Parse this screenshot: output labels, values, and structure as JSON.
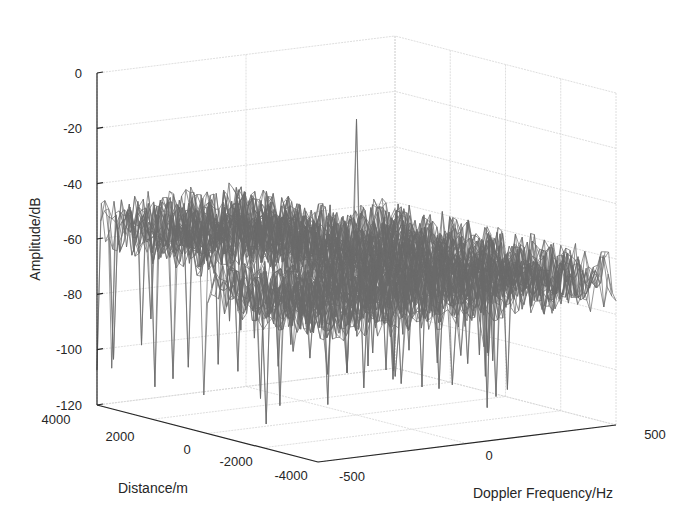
{
  "chart_data": {
    "type": "surface3d",
    "title": "",
    "xlabel": "Doppler Frequency/Hz",
    "ylabel": "Distance/m",
    "zlabel": "Amplitude/dB",
    "x_ticks": [
      "-500",
      "0",
      "500"
    ],
    "y_ticks": [
      "4000",
      "2000",
      "0",
      "-2000",
      "-4000"
    ],
    "z_ticks": [
      "0",
      "-20",
      "-40",
      "-60",
      "-80",
      "-100",
      "-120"
    ],
    "xlim": [
      -500,
      500
    ],
    "ylim": [
      -4000,
      4000
    ],
    "zlim": [
      -120,
      0
    ],
    "grid": true,
    "legend": null,
    "surface": {
      "noise_floor_db": -68,
      "noise_spread_db": 10,
      "deep_nulls_db": [
        -100,
        -115
      ],
      "raised_region": {
        "doppler_range_hz": [
          -500,
          0
        ],
        "distance_range_m": [
          0,
          4000
        ],
        "level_db": -55
      },
      "peak": {
        "doppler_hz": 0,
        "distance_m": 0,
        "amplitude_db": -13
      }
    },
    "mesh_color": "#6a6a6a",
    "grid_color": "#d6d6d6",
    "axis_color": "#262626"
  }
}
